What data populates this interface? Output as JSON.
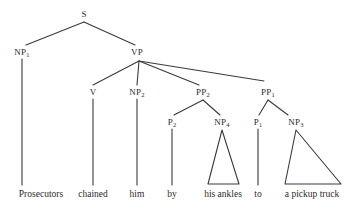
{
  "figure": {
    "type": "syntax-tree",
    "sentence": "Prosecutors chained him by his ankles to a pickup truck",
    "line_color": "#3a3a3a",
    "text_color": "#2b2b2b",
    "background_color": "#ffffff"
  },
  "nodes": [
    {
      "id": "S",
      "base": "S",
      "sub": "",
      "x": 84,
      "y": 14
    },
    {
      "id": "NP1",
      "base": "NP",
      "sub": "1",
      "x": 22,
      "y": 52
    },
    {
      "id": "VP",
      "base": "VP",
      "sub": "",
      "x": 137,
      "y": 52
    },
    {
      "id": "V",
      "base": "V",
      "sub": "",
      "x": 93,
      "y": 92
    },
    {
      "id": "NP2",
      "base": "NP",
      "sub": "2",
      "x": 137,
      "y": 92
    },
    {
      "id": "PP2",
      "base": "PP",
      "sub": "2",
      "x": 203,
      "y": 92
    },
    {
      "id": "PP1",
      "base": "PP",
      "sub": "1",
      "x": 268,
      "y": 92
    },
    {
      "id": "P2",
      "base": "P",
      "sub": "2",
      "x": 172,
      "y": 122
    },
    {
      "id": "NP4",
      "base": "NP",
      "sub": "4",
      "x": 222,
      "y": 122
    },
    {
      "id": "P1",
      "base": "P",
      "sub": "1",
      "x": 258,
      "y": 122
    },
    {
      "id": "NP3",
      "base": "NP",
      "sub": "3",
      "x": 296,
      "y": 122
    }
  ],
  "terminals": [
    {
      "id": "w1",
      "text": "Prosecutors",
      "x": 41,
      "y": 190
    },
    {
      "id": "w2",
      "text": "chained",
      "x": 93,
      "y": 190
    },
    {
      "id": "w3",
      "text": "him",
      "x": 137,
      "y": 190
    },
    {
      "id": "w4",
      "text": "by",
      "x": 172,
      "y": 190
    },
    {
      "id": "w5",
      "text": "his ankles",
      "x": 223,
      "y": 190
    },
    {
      "id": "w6",
      "text": "to",
      "x": 258,
      "y": 190
    },
    {
      "id": "w7",
      "text": "a pickup truck",
      "x": 312,
      "y": 190
    }
  ],
  "branches": [
    {
      "from": "S",
      "to": "NP1",
      "x1": 84,
      "y1": 22,
      "x2": 26,
      "y2": 45
    },
    {
      "from": "S",
      "to": "VP",
      "x1": 84,
      "y1": 22,
      "x2": 135,
      "y2": 45
    },
    {
      "from": "VP",
      "to": "V",
      "x1": 139,
      "y1": 61,
      "x2": 93,
      "y2": 85
    },
    {
      "from": "VP",
      "to": "NP2",
      "x1": 139,
      "y1": 61,
      "x2": 137,
      "y2": 85
    },
    {
      "from": "VP",
      "to": "PP2",
      "x1": 139,
      "y1": 61,
      "x2": 199,
      "y2": 85
    },
    {
      "from": "VP",
      "to": "PP1",
      "x1": 139,
      "y1": 61,
      "x2": 264,
      "y2": 81
    },
    {
      "from": "PP2",
      "to": "P2",
      "x1": 203,
      "y1": 100,
      "x2": 174,
      "y2": 115
    },
    {
      "from": "PP2",
      "to": "NP4",
      "x1": 203,
      "y1": 100,
      "x2": 220,
      "y2": 115
    },
    {
      "from": "PP1",
      "to": "P1",
      "x1": 268,
      "y1": 100,
      "x2": 259,
      "y2": 115
    },
    {
      "from": "PP1",
      "to": "NP3",
      "x1": 268,
      "y1": 100,
      "x2": 288,
      "y2": 115
    }
  ],
  "stems": [
    {
      "id": "stem-np1",
      "x": 22,
      "y1": 59,
      "y2": 185
    },
    {
      "id": "stem-v",
      "x": 93,
      "y1": 99,
      "y2": 185
    },
    {
      "id": "stem-np2",
      "x": 137,
      "y1": 99,
      "y2": 185
    },
    {
      "id": "stem-p2",
      "x": 172,
      "y1": 129,
      "y2": 185
    },
    {
      "id": "stem-p1",
      "x": 258,
      "y1": 129,
      "y2": 185
    }
  ],
  "triangles": [
    {
      "id": "tri-np4",
      "apex_x": 222,
      "apex_y": 130,
      "left_x": 208,
      "right_x": 239,
      "base_y": 184
    },
    {
      "id": "tri-np3",
      "apex_x": 296,
      "apex_y": 130,
      "left_x": 285,
      "right_x": 341,
      "base_y": 184
    }
  ]
}
